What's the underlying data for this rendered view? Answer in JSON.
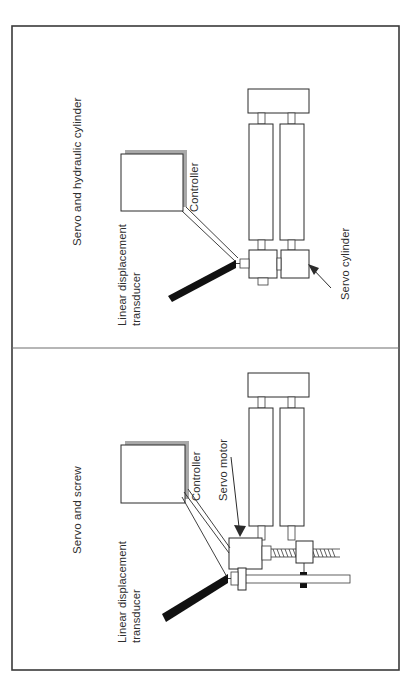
{
  "figure": {
    "orientation": "rotated-90-ccw",
    "border_color": "#3a3a3a",
    "background_color": "#ffffff",
    "panel_count": 2
  },
  "panels": [
    {
      "id": "panel-hydraulic",
      "title": "Servo and hydraulic cylinder",
      "labels": {
        "controller": "Controller",
        "transducer_line1": "Linear displacement",
        "transducer_line2": "transducer",
        "actuator": "Servo cylinder"
      },
      "components": [
        "controller-box",
        "linear-displacement-transducer",
        "servo-cylinder",
        "cylinder-barrel-pair",
        "end-cap-block"
      ]
    },
    {
      "id": "panel-screw",
      "title": "Servo and screw",
      "labels": {
        "controller": "Controller",
        "transducer_line1": "Linear displacement",
        "transducer_line2": "transducer",
        "actuator": "Servo motor"
      },
      "components": [
        "controller-box",
        "linear-displacement-transducer",
        "servo-motor",
        "lead-screw",
        "screw-nut-block",
        "guide-rod",
        "cylinder-barrel-pair",
        "end-cap-block"
      ]
    }
  ],
  "colors": {
    "line": "#2b2b2b",
    "frame": "#3a3a3a",
    "divider": "#6e6e6e",
    "shadow": "#a8a8a8",
    "solid_fill": "#111111",
    "text": "#2e2e2e",
    "paper": "#ffffff"
  }
}
